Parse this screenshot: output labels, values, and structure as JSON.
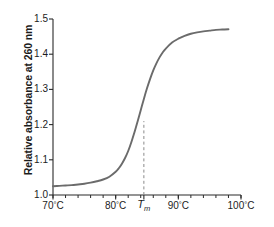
{
  "chart_data": {
    "type": "line",
    "title": "",
    "xlabel": "",
    "ylabel": "Relative absorbance at 260 nm",
    "xlim": [
      70,
      100
    ],
    "ylim": [
      1.0,
      1.5
    ],
    "grid": false,
    "legend": null,
    "x_tick_labels": [
      "70°C",
      "80°C",
      "Tₘ",
      "90°C",
      "100°C"
    ],
    "x_major_ticks": [
      70,
      80,
      84.5,
      90,
      100
    ],
    "x_minor_tick_step": 2,
    "y_tick_labels": [
      "1.0",
      "1.1",
      "1.2",
      "1.3",
      "1.4",
      "1.5"
    ],
    "y_major_ticks": [
      1.0,
      1.1,
      1.2,
      1.3,
      1.4,
      1.5
    ],
    "annotations": [
      {
        "name": "tm-dashed-line",
        "type": "vline",
        "x": 84.5,
        "y_from": 1.0,
        "y_to": 1.21,
        "style": "dashed",
        "color": "#808080"
      }
    ],
    "series": [
      {
        "name": "melting-curve",
        "color": "#6b6b6b",
        "x": [
          70,
          71,
          72,
          73,
          74,
          75,
          76,
          77,
          78,
          79,
          80,
          80.5,
          81,
          81.5,
          82,
          82.5,
          83,
          83.5,
          84,
          84.5,
          85,
          85.5,
          86,
          86.5,
          87,
          87.5,
          88,
          89,
          90,
          91,
          92,
          93,
          94,
          95,
          96,
          97,
          98
        ],
        "y": [
          1.025,
          1.026,
          1.027,
          1.028,
          1.03,
          1.032,
          1.035,
          1.039,
          1.044,
          1.052,
          1.066,
          1.076,
          1.089,
          1.105,
          1.125,
          1.15,
          1.178,
          1.209,
          1.241,
          1.273,
          1.303,
          1.33,
          1.354,
          1.374,
          1.391,
          1.405,
          1.416,
          1.433,
          1.444,
          1.452,
          1.458,
          1.462,
          1.465,
          1.467,
          1.469,
          1.47,
          1.471
        ]
      }
    ]
  },
  "axis_labels": {
    "y_title": "Relative absorbance at 260 nm"
  },
  "colors": {
    "curve": "#6b6b6b",
    "axis": "#2a2a2a",
    "dash": "#8a8a8a",
    "text": "#1c1c1c",
    "background": "#ffffff"
  }
}
